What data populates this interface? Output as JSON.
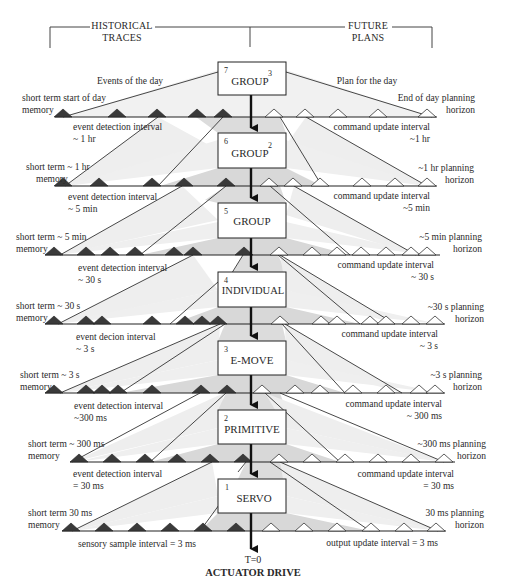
{
  "header": {
    "left_title_line1": "HISTORICAL",
    "left_title_line2": "TRACES",
    "right_title_line1": "FUTURE",
    "right_title_line2": "PLANS"
  },
  "colors": {
    "line": "#2b2b2b",
    "past_triangle": "#3c3c3c",
    "future_triangle": "#ffffff",
    "outer_fill": "#ececec",
    "inner_fill": "#d9d9d9",
    "box_fill": "#ffffff"
  },
  "top": {
    "events_label": "Events of the day",
    "plan_label": "Plan for the day"
  },
  "levels": [
    {
      "level": "7",
      "name": "GROUP",
      "superscript": "3"
    },
    {
      "level": "6",
      "name": "GROUP",
      "superscript": "2"
    },
    {
      "level": "5",
      "name": "GROUP",
      "superscript": ""
    },
    {
      "level": "4",
      "name": "INDIVIDUAL",
      "superscript": ""
    },
    {
      "level": "3",
      "name": "E-MOVE",
      "superscript": ""
    },
    {
      "level": "2",
      "name": "PRIMITIVE",
      "superscript": ""
    },
    {
      "level": "1",
      "name": "SERVO",
      "superscript": ""
    }
  ],
  "timelines": [
    {
      "memory_line1": "short term start of day",
      "memory_line2": "memory",
      "horizon_line1": "End of day planning",
      "horizon_line2": "horizon",
      "event_interval_line1": "event detection interval",
      "event_interval_line2": "~ 1 hr",
      "command_interval_line1": "command update interval",
      "command_interval_line2": "~1 hr"
    },
    {
      "memory_line1": "short term ~ 1 hr",
      "memory_line2": "memory",
      "horizon_line1": "~1 hr planning",
      "horizon_line2": "horizon",
      "event_interval_line1": "event detection interval",
      "event_interval_line2": "~ 5 min",
      "command_interval_line1": "command update interval",
      "command_interval_line2": "~5 min"
    },
    {
      "memory_line1": "short term ~ 5 min",
      "memory_line2": "memory",
      "horizon_line1": "~5 min planning",
      "horizon_line2": "horizon",
      "event_interval_line1": "event detection interval",
      "event_interval_line2": "~ 30 s",
      "command_interval_line1": "command update interval",
      "command_interval_line2": "~ 30 s"
    },
    {
      "memory_line1": "short term ~ 30 s",
      "memory_line2": "memory",
      "horizon_line1": "~30 s planning",
      "horizon_line2": "horizon",
      "event_interval_line1": "event decion interval",
      "event_interval_line2": "~ 3 s",
      "command_interval_line1": "command update interval",
      "command_interval_line2": "~ 3 s"
    },
    {
      "memory_line1": "short term ~ 3 s",
      "memory_line2": "memory",
      "horizon_line1": "~3 s planning",
      "horizon_line2": "horizon",
      "event_interval_line1": "event detection interval",
      "event_interval_line2": "~300 ms",
      "command_interval_line1": "command update interval",
      "command_interval_line2": "~ 300 ms"
    },
    {
      "memory_line1": "short term ~ 300 ms",
      "memory_line2": "memory",
      "horizon_line1": "~300 ms planning",
      "horizon_line2": "horizon",
      "event_interval_line1": "event detection interval",
      "event_interval_line2": "= 30 ms",
      "command_interval_line1": "command update interval",
      "command_interval_line2": "= 30 ms"
    },
    {
      "memory_line1": "short term 30 ms",
      "memory_line2": "memory",
      "horizon_line1": "30 ms planning",
      "horizon_line2": "horizon",
      "event_interval_line1": "sensory sample interval = 3 ms",
      "event_interval_line2": "",
      "command_interval_line1": "output update interval = 3 ms",
      "command_interval_line2": ""
    }
  ],
  "bottom": {
    "time_label": "T=0",
    "output_label": "ACTUATOR DRIVE"
  }
}
